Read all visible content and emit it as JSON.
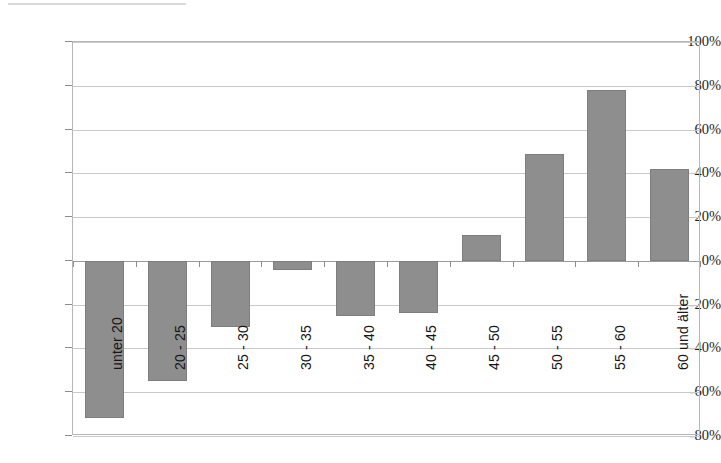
{
  "chart_data": {
    "type": "bar",
    "title": "",
    "subtitle": "",
    "xlabel": "",
    "ylabel": "",
    "categories": [
      "unter 20",
      "20 - 25",
      "25 - 30",
      "30 - 35",
      "35 - 40",
      "40 - 45",
      "45 - 50",
      "50 - 55",
      "55 - 60",
      "60 und älter"
    ],
    "values": [
      -72,
      -55,
      -30,
      -4,
      -25,
      -24,
      12,
      49,
      78,
      42
    ],
    "ylim": [
      -80,
      100
    ],
    "ytick_values": [
      100,
      80,
      60,
      40,
      20,
      0,
      -20,
      -40,
      -60,
      -80
    ],
    "ytick_labels": [
      "100%",
      "80%",
      "60%",
      "40%",
      "20%",
      "0%",
      "-20%",
      "-40%",
      "-60%",
      "-80%"
    ],
    "grid": true,
    "legend": "none",
    "bar_color": "#8e8e8e",
    "gridline_color": "#c9c9c9",
    "axis_color": "#8d8d8d",
    "background_color": "#ffffff",
    "value_format": "percent",
    "category_label_rotation": -90
  },
  "axes": {
    "y_axis_name": "percent-axis",
    "x_axis_name": "age-group-axis"
  }
}
